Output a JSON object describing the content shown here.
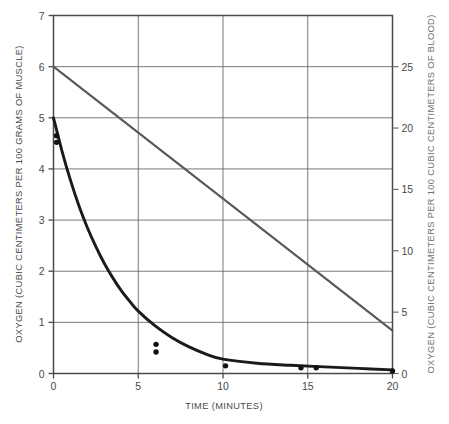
{
  "chart_data": {
    "type": "line",
    "title": "",
    "xlabel": "TIME (MINUTES)",
    "ylabel": "OXYGEN (CUBIC CENTIMETERS PER 100 GRAMS OF MUSCLE)",
    "ylabel_right": "OXYGEN (CUBIC CENTIMETERS PER 100 CUBIC CENTIMETERS OF BLOOD)",
    "xlim": [
      0,
      20
    ],
    "ylim": [
      0,
      7
    ],
    "ylim_right": [
      0,
      29.17
    ],
    "xticks": [
      0,
      5,
      10,
      15,
      20
    ],
    "xticklabels": [
      "0",
      "5",
      "10",
      "15",
      "20"
    ],
    "yticks": [
      0,
      1,
      2,
      3,
      4,
      5,
      6,
      7
    ],
    "yticklabels": [
      "0",
      "1",
      "2",
      "3",
      "4",
      "5",
      "6",
      "7"
    ],
    "yticks_right": [
      0,
      5,
      10,
      15,
      20,
      25
    ],
    "yticklabels_right": [
      "0",
      "5",
      "10",
      "15",
      "20",
      "25"
    ],
    "grid": true,
    "legend": "none",
    "series": [
      {
        "name": "muscle-oxygen-decay-curve",
        "axis": "left",
        "style": "solid-thick",
        "color": "#1a1a1a",
        "x": [
          0.0,
          0.5,
          1.0,
          1.5,
          2.0,
          2.5,
          3.0,
          3.5,
          4.0,
          4.5,
          5.0,
          6.0,
          7.0,
          8.0,
          9.0,
          10.0,
          12.0,
          14.0,
          16.0,
          18.0,
          20.0
        ],
        "y": [
          5.0,
          4.35,
          3.78,
          3.28,
          2.85,
          2.48,
          2.15,
          1.87,
          1.62,
          1.41,
          1.22,
          0.93,
          0.7,
          0.52,
          0.38,
          0.28,
          0.2,
          0.16,
          0.13,
          0.1,
          0.07
        ]
      },
      {
        "name": "blood-oxygen-linear-line",
        "axis": "right",
        "style": "solid-medium",
        "color": "#5a5a5a",
        "x": [
          0,
          20
        ],
        "y": [
          25.0,
          3.5
        ]
      }
    ],
    "scatter_points": [
      {
        "x": 0.18,
        "y": 4.65,
        "axis": "left"
      },
      {
        "x": 0.18,
        "y": 4.52,
        "axis": "left"
      },
      {
        "x": 6.05,
        "y": 0.57,
        "axis": "left"
      },
      {
        "x": 6.05,
        "y": 0.42,
        "axis": "left"
      },
      {
        "x": 10.15,
        "y": 0.15,
        "axis": "left"
      },
      {
        "x": 14.6,
        "y": 0.11,
        "axis": "left"
      },
      {
        "x": 15.5,
        "y": 0.11,
        "axis": "left"
      },
      {
        "x": 20.0,
        "y": 0.05,
        "axis": "left"
      }
    ],
    "colors": {
      "background": "#ffffff",
      "axis": "#4a4a4a",
      "grid": "#6a6a6a",
      "curve": "#1a1a1a",
      "line": "#5a5a5a",
      "marker": "#111111",
      "text_left": "#4a4a4a",
      "text_right": "#6e6e6e"
    }
  }
}
